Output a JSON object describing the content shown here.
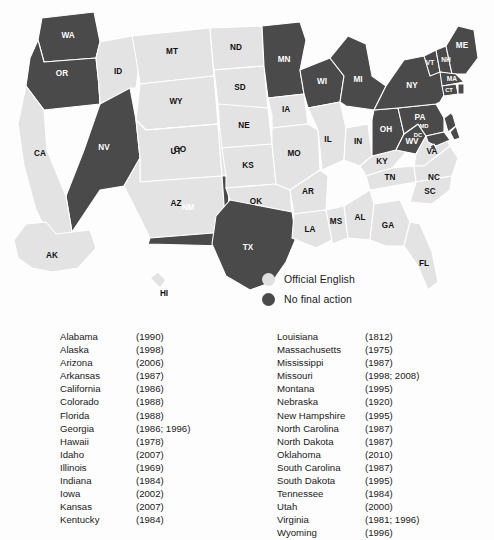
{
  "legend": {
    "items": [
      {
        "label": "Official English",
        "color": "#e0e0e0",
        "key": "official"
      },
      {
        "label": "No final action",
        "color": "#4a4a4a",
        "key": "nofinal"
      }
    ]
  },
  "map": {
    "colors": {
      "official_english": "#e3e3e3",
      "no_final_action": "#4a4a4a",
      "border": "#ffffff",
      "background": "#fdfdfd"
    },
    "states": [
      {
        "abbr": "WA",
        "status": "nofinal"
      },
      {
        "abbr": "OR",
        "status": "nofinal"
      },
      {
        "abbr": "NV",
        "status": "nofinal"
      },
      {
        "abbr": "CA",
        "status": "official"
      },
      {
        "abbr": "ID",
        "status": "official"
      },
      {
        "abbr": "MT",
        "status": "official"
      },
      {
        "abbr": "WY",
        "status": "official"
      },
      {
        "abbr": "UT",
        "status": "official"
      },
      {
        "abbr": "AZ",
        "status": "official"
      },
      {
        "abbr": "CO",
        "status": "official"
      },
      {
        "abbr": "NM",
        "status": "nofinal"
      },
      {
        "abbr": "ND",
        "status": "official"
      },
      {
        "abbr": "SD",
        "status": "official"
      },
      {
        "abbr": "NE",
        "status": "official"
      },
      {
        "abbr": "KS",
        "status": "official"
      },
      {
        "abbr": "OK",
        "status": "official"
      },
      {
        "abbr": "TX",
        "status": "nofinal"
      },
      {
        "abbr": "MN",
        "status": "nofinal"
      },
      {
        "abbr": "IA",
        "status": "official"
      },
      {
        "abbr": "MO",
        "status": "official"
      },
      {
        "abbr": "AR",
        "status": "official"
      },
      {
        "abbr": "LA",
        "status": "official"
      },
      {
        "abbr": "WI",
        "status": "nofinal"
      },
      {
        "abbr": "IL",
        "status": "official"
      },
      {
        "abbr": "MS",
        "status": "official"
      },
      {
        "abbr": "MI",
        "status": "nofinal"
      },
      {
        "abbr": "IN",
        "status": "official"
      },
      {
        "abbr": "KY",
        "status": "official"
      },
      {
        "abbr": "TN",
        "status": "official"
      },
      {
        "abbr": "AL",
        "status": "official"
      },
      {
        "abbr": "GA",
        "status": "official"
      },
      {
        "abbr": "OH",
        "status": "nofinal"
      },
      {
        "abbr": "WV",
        "status": "nofinal"
      },
      {
        "abbr": "VA",
        "status": "official"
      },
      {
        "abbr": "NC",
        "status": "official"
      },
      {
        "abbr": "SC",
        "status": "official"
      },
      {
        "abbr": "FL",
        "status": "official"
      },
      {
        "abbr": "PA",
        "status": "nofinal"
      },
      {
        "abbr": "NY",
        "status": "nofinal"
      },
      {
        "abbr": "VT",
        "status": "nofinal"
      },
      {
        "abbr": "NH",
        "status": "nofinal"
      },
      {
        "abbr": "ME",
        "status": "nofinal"
      },
      {
        "abbr": "MA",
        "status": "nofinal"
      },
      {
        "abbr": "CT",
        "status": "nofinal"
      },
      {
        "abbr": "RI",
        "status": "nofinal"
      },
      {
        "abbr": "NJ",
        "status": "nofinal"
      },
      {
        "abbr": "DE",
        "status": "nofinal"
      },
      {
        "abbr": "MD",
        "status": "nofinal"
      },
      {
        "abbr": "DC",
        "status": "nofinal"
      },
      {
        "abbr": "AK",
        "status": "official"
      },
      {
        "abbr": "HI",
        "status": "official"
      }
    ]
  },
  "list_left": [
    {
      "state": "Alabama",
      "year": "(1990)"
    },
    {
      "state": "Alaska",
      "year": "(1998)"
    },
    {
      "state": "Arizona",
      "year": "(2006)"
    },
    {
      "state": "Arkansas",
      "year": "(1987)"
    },
    {
      "state": "California",
      "year": "(1986)"
    },
    {
      "state": "Colorado",
      "year": "(1988)"
    },
    {
      "state": "Florida",
      "year": "(1988)"
    },
    {
      "state": "Georgia",
      "year": "(1986; 1996)"
    },
    {
      "state": "Hawaii",
      "year": "(1978)"
    },
    {
      "state": "Idaho",
      "year": "(2007)"
    },
    {
      "state": "Illinois",
      "year": "(1969)"
    },
    {
      "state": "Indiana",
      "year": "(1984)"
    },
    {
      "state": "Iowa",
      "year": "(2002)"
    },
    {
      "state": "Kansas",
      "year": "(2007)"
    },
    {
      "state": "Kentucky",
      "year": "(1984)"
    }
  ],
  "list_right": [
    {
      "state": "Louisiana",
      "year": "(1812)"
    },
    {
      "state": "Massachusetts",
      "year": "(1975)"
    },
    {
      "state": "Mississippi",
      "year": "(1987)"
    },
    {
      "state": "Missouri",
      "year": "(1998; 2008)"
    },
    {
      "state": "Montana",
      "year": "(1995)"
    },
    {
      "state": "Nebraska",
      "year": "(1920)"
    },
    {
      "state": "New Hampshire",
      "year": "(1995)"
    },
    {
      "state": "North Carolina",
      "year": "(1987)"
    },
    {
      "state": "North Dakota",
      "year": "(1987)"
    },
    {
      "state": "Oklahoma",
      "year": "(2010)"
    },
    {
      "state": "South Carolina",
      "year": "(1987)"
    },
    {
      "state": "South Dakota",
      "year": "(1995)"
    },
    {
      "state": "Tennessee",
      "year": "(1984)"
    },
    {
      "state": "Utah",
      "year": "(2000)"
    },
    {
      "state": "Virginia",
      "year": "(1981; 1996)"
    },
    {
      "state": "Wyoming",
      "year": "(1996)"
    }
  ]
}
